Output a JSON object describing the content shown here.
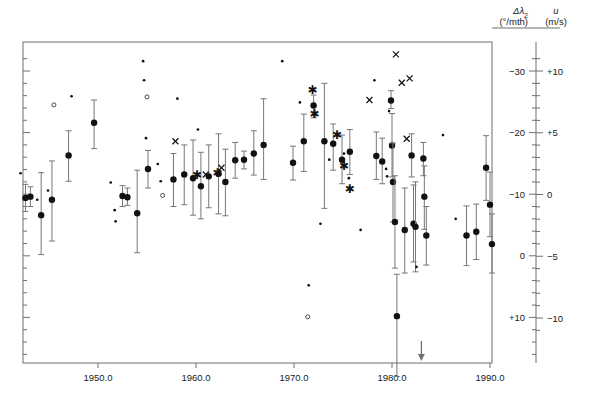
{
  "chart_data": {
    "type": "scatter",
    "title": "",
    "xlabel": "",
    "ylabel": "",
    "xlim": [
      1941.5,
      1991.5
    ],
    "xticks": [
      1950,
      1960,
      1970,
      1980,
      1990
    ],
    "xticklabels": [
      "1950.0",
      "1960.0",
      "1970.0",
      "1980.0",
      "1990.0"
    ],
    "grid": false,
    "legend": "none",
    "axes": {
      "left": {
        "label_symbol": "Δλ",
        "label_sub": "2",
        "label_units": "(°/mth)",
        "ticks": [
          -30,
          -20,
          -10,
          0,
          10,
          20
        ],
        "ticklabels": [
          "−30",
          "−20",
          "−10",
          "0",
          "+10",
          "+20"
        ],
        "minor_step": 2,
        "lim": [
          -33.5,
          21.0
        ],
        "direction": "inverted"
      },
      "right": {
        "label_symbol": "u",
        "label_units": "(m/s)",
        "ticks": [
          10,
          5,
          0,
          -5,
          -10
        ],
        "ticklabels": [
          "+10",
          "+5",
          "0",
          "−5",
          "−10"
        ],
        "minor_step": 1,
        "lim": [
          11.8,
          -10.9
        ],
        "direction": "inverted"
      }
    },
    "annotations": [
      {
        "name": "down-arrow",
        "x": 1983.0,
        "type": "arrow-down",
        "note": "arrow marker below axis"
      }
    ],
    "series": [
      {
        "name": "primary-with-errorbars",
        "marker": "filled-circle",
        "color": "#111111",
        "points": [
          {
            "x": 1942.6,
            "y": -9.4,
            "lo": -11.6,
            "hi": -7.2
          },
          {
            "x": 1943.1,
            "y": -9.6,
            "lo": -11.2,
            "hi": -8.0
          },
          {
            "x": 1944.2,
            "y": -6.6,
            "lo": -13.5,
            "hi": -0.2
          },
          {
            "x": 1945.3,
            "y": -9.1,
            "lo": -15.4,
            "hi": -2.4
          },
          {
            "x": 1947.0,
            "y": -16.3,
            "lo": -20.3,
            "hi": -12.1
          },
          {
            "x": 1949.6,
            "y": -21.6,
            "lo": -25.3,
            "hi": -17.4
          },
          {
            "x": 1952.5,
            "y": -9.7,
            "lo": -11.4,
            "hi": -8.0
          },
          {
            "x": 1953.0,
            "y": -9.5,
            "lo": -11.0,
            "hi": -8.2
          },
          {
            "x": 1954.0,
            "y": -6.9,
            "lo": -13.9,
            "hi": -0.5
          },
          {
            "x": 1955.1,
            "y": -14.1,
            "lo": -17.1,
            "hi": -11.0
          },
          {
            "x": 1957.7,
            "y": -12.4,
            "lo": -16.6,
            "hi": -8.0
          },
          {
            "x": 1958.8,
            "y": -13.2,
            "lo": -18.0,
            "hi": -8.3
          },
          {
            "x": 1959.7,
            "y": -12.6,
            "lo": -18.8,
            "hi": -6.6
          },
          {
            "x": 1960.5,
            "y": -11.3,
            "lo": -16.8,
            "hi": -6.0
          },
          {
            "x": 1961.3,
            "y": -12.9,
            "lo": -18.0,
            "hi": -7.8
          },
          {
            "x": 1962.3,
            "y": -13.3,
            "lo": -19.8,
            "hi": -6.8
          },
          {
            "x": 1963.0,
            "y": -12.0,
            "lo": -17.3,
            "hi": -6.5
          },
          {
            "x": 1964.0,
            "y": -15.5,
            "lo": -18.4,
            "hi": -12.6
          },
          {
            "x": 1964.9,
            "y": -15.6,
            "lo": -17.0,
            "hi": -14.1
          },
          {
            "x": 1965.9,
            "y": -16.6,
            "lo": -20.3,
            "hi": -13.1
          },
          {
            "x": 1966.9,
            "y": -18.0,
            "lo": -25.5,
            "hi": -12.4
          },
          {
            "x": 1969.9,
            "y": -15.1,
            "lo": -17.8,
            "hi": -12.3
          },
          {
            "x": 1971.0,
            "y": -18.6,
            "lo": -23.0,
            "hi": -13.7
          },
          {
            "x": 1972.0,
            "y": -24.4,
            "lo": -26.1,
            "hi": -22.4
          },
          {
            "x": 1973.1,
            "y": -18.6,
            "lo": -28.0,
            "hi": -7.7
          },
          {
            "x": 1974.0,
            "y": -18.2,
            "lo": -21.4,
            "hi": -13.9
          },
          {
            "x": 1974.9,
            "y": -15.6,
            "lo": -19.6,
            "hi": -11.7
          },
          {
            "x": 1975.7,
            "y": -16.9,
            "lo": -20.5,
            "hi": -13.2
          },
          {
            "x": 1978.4,
            "y": -16.2,
            "lo": -20.1,
            "hi": -12.4
          },
          {
            "x": 1979.0,
            "y": -15.3,
            "lo": -19.1,
            "hi": -11.7
          },
          {
            "x": 1979.9,
            "y": -25.2,
            "lo": -26.8,
            "hi": -23.9
          },
          {
            "x": 1980.0,
            "y": -17.9,
            "lo": -23.1,
            "hi": -12.8
          },
          {
            "x": 1980.1,
            "y": -12.0,
            "lo": -18.3,
            "hi": -5.5
          },
          {
            "x": 1980.3,
            "y": -5.5,
            "lo": -13.0,
            "hi": 2.0
          },
          {
            "x": 1980.5,
            "y": 9.8,
            "lo": 3.0,
            "hi": 19.6
          },
          {
            "x": 1981.3,
            "y": -4.2,
            "lo": -11.0,
            "hi": 2.8
          },
          {
            "x": 1982.0,
            "y": -16.3,
            "lo": -19.8,
            "hi": -12.8
          },
          {
            "x": 1982.2,
            "y": -5.2,
            "lo": -11.5,
            "hi": 1.0
          },
          {
            "x": 1982.4,
            "y": -4.7,
            "lo": -12.0,
            "hi": 2.6
          },
          {
            "x": 1983.2,
            "y": -15.8,
            "lo": -18.4,
            "hi": -13.0
          },
          {
            "x": 1983.3,
            "y": -9.6,
            "lo": -14.6,
            "hi": -4.3
          },
          {
            "x": 1983.5,
            "y": -3.3,
            "lo": -8.0,
            "hi": 1.5
          },
          {
            "x": 1987.6,
            "y": -3.3,
            "lo": -8.1,
            "hi": 1.6
          },
          {
            "x": 1988.6,
            "y": -3.9,
            "lo": -8.4,
            "hi": 0.6
          },
          {
            "x": 1989.6,
            "y": -14.3,
            "lo": -19.5,
            "hi": -9.0
          },
          {
            "x": 1990.0,
            "y": -8.3,
            "lo": -13.6,
            "hi": -3.1
          },
          {
            "x": 1990.2,
            "y": -1.9,
            "lo": -6.8,
            "hi": 2.8
          }
        ]
      },
      {
        "name": "small-dots",
        "marker": "small-dot",
        "color": "#111111",
        "points": [
          {
            "x": 1942.1,
            "y": -13.4
          },
          {
            "x": 1943.8,
            "y": -9.1
          },
          {
            "x": 1944.9,
            "y": -10.6
          },
          {
            "x": 1947.3,
            "y": -25.9
          },
          {
            "x": 1951.3,
            "y": -11.9
          },
          {
            "x": 1951.7,
            "y": -7.4
          },
          {
            "x": 1951.8,
            "y": -5.6
          },
          {
            "x": 1954.6,
            "y": -31.6
          },
          {
            "x": 1954.7,
            "y": -28.5
          },
          {
            "x": 1954.9,
            "y": -19.1
          },
          {
            "x": 1956.1,
            "y": -14.9
          },
          {
            "x": 1956.4,
            "y": -12.1
          },
          {
            "x": 1958.1,
            "y": -25.5
          },
          {
            "x": 1960.2,
            "y": -20.5
          },
          {
            "x": 1968.8,
            "y": -31.6
          },
          {
            "x": 1970.6,
            "y": -24.9
          },
          {
            "x": 1971.5,
            "y": 4.8
          },
          {
            "x": 1972.7,
            "y": -5.2
          },
          {
            "x": 1973.6,
            "y": -15.6
          },
          {
            "x": 1975.1,
            "y": -16.6
          },
          {
            "x": 1975.6,
            "y": -12.6
          },
          {
            "x": 1976.8,
            "y": -4.2
          },
          {
            "x": 1978.2,
            "y": -28.5
          },
          {
            "x": 1979.4,
            "y": -14.1
          },
          {
            "x": 1979.5,
            "y": -12.9
          },
          {
            "x": 1979.7,
            "y": -23.5
          },
          {
            "x": 1982.5,
            "y": 1.8
          },
          {
            "x": 1985.2,
            "y": -19.6
          },
          {
            "x": 1986.5,
            "y": -6.0
          }
        ]
      },
      {
        "name": "open-circles",
        "marker": "open-circle",
        "color": "#4a4a4a",
        "points": [
          {
            "x": 1945.5,
            "y": -24.5
          },
          {
            "x": 1955.0,
            "y": -25.8
          },
          {
            "x": 1956.6,
            "y": -9.8
          },
          {
            "x": 1971.4,
            "y": 9.9
          }
        ]
      },
      {
        "name": "asterisks",
        "marker": "asterisk",
        "color": "#111111",
        "points": [
          {
            "x": 1960.1,
            "y": -13.1
          },
          {
            "x": 1962.2,
            "y": -13.3
          },
          {
            "x": 1971.9,
            "y": -26.8
          },
          {
            "x": 1972.1,
            "y": -23.0
          },
          {
            "x": 1974.4,
            "y": -19.5
          },
          {
            "x": 1975.1,
            "y": -14.5
          },
          {
            "x": 1975.7,
            "y": -10.8
          }
        ]
      },
      {
        "name": "x-marks",
        "marker": "x-mark",
        "color": "#111111",
        "points": [
          {
            "x": 1957.9,
            "y": -18.6
          },
          {
            "x": 1961.0,
            "y": -13.2
          },
          {
            "x": 1962.6,
            "y": -14.3
          },
          {
            "x": 1977.7,
            "y": -25.3
          },
          {
            "x": 1980.4,
            "y": -32.7
          },
          {
            "x": 1981.0,
            "y": -28.1
          },
          {
            "x": 1981.8,
            "y": -28.8
          },
          {
            "x": 1981.5,
            "y": -19.0
          }
        ]
      }
    ]
  }
}
